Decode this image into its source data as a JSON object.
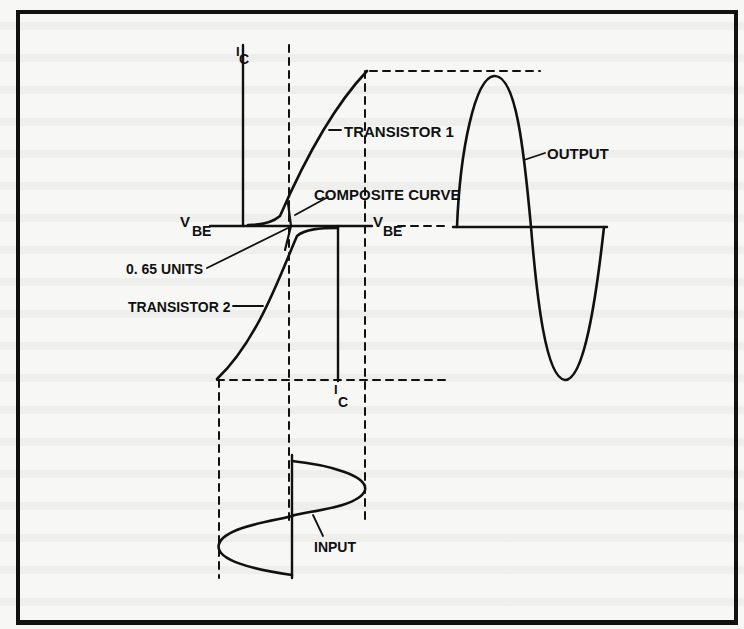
{
  "figure": {
    "type": "transistor transfer characteristic diagram (push-pull crossover)",
    "colors": {
      "ink": "#111111",
      "paper": "#f7f7f5"
    },
    "labels": {
      "ic_top": "I",
      "ic_top_sub": "C",
      "transistor_1": "TRANSISTOR 1",
      "composite_curve": "COMPOSITE CURVE",
      "vbe_left": "V",
      "vbe_left_sub": "BE",
      "vbe_right": "V",
      "vbe_right_sub": "BE",
      "threshold": "0. 65 UNITS",
      "transistor_2": "TRANSISTOR 2",
      "ic_bottom": "I",
      "ic_bottom_sub": "C",
      "output": "OUTPUT",
      "input": "INPUT"
    }
  }
}
